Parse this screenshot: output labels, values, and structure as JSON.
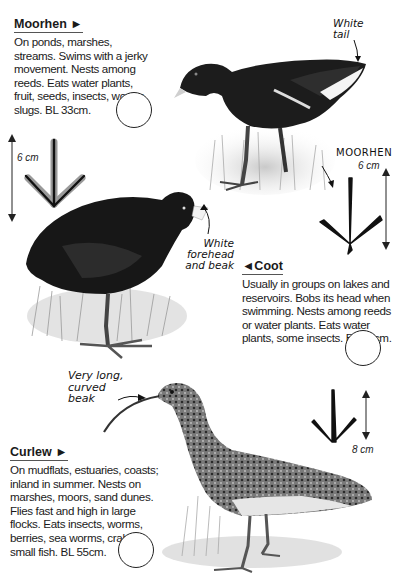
{
  "entries": {
    "moorhen": {
      "title": "Moorhen ►",
      "text": "On ponds, marshes, streams. Swims with a jerky movement. Nests among reeds. Eats water plants, fruit, seeds, insects, worms, slugs. BL 33cm."
    },
    "coot": {
      "title": "◄Coot",
      "text": "Usually in groups on lakes and reservoirs. Bobs its head when swimming. Nests among reeds or water plants. Eats water plants, some insects. BL 38cm."
    },
    "curlew": {
      "title": "Curlew ►",
      "text": "On mudflats, estuaries, coasts; inland in summer. Nests on marshes, moors, sand dunes. Flies fast and high in large flocks. Eats insects, worms, berries, sea worms, crabs, small fish. BL 55cm."
    }
  },
  "annotations": {
    "white_tail": "White tail",
    "white_forehead": "White forehead and beak",
    "curved_beak": "Very long, curved beak"
  },
  "footprints": {
    "coot_print": {
      "size": "6 cm"
    },
    "moorhen_print": {
      "label": "MOORHEN",
      "size": "6 cm"
    },
    "curlew_print": {
      "size": "8 cm"
    }
  }
}
